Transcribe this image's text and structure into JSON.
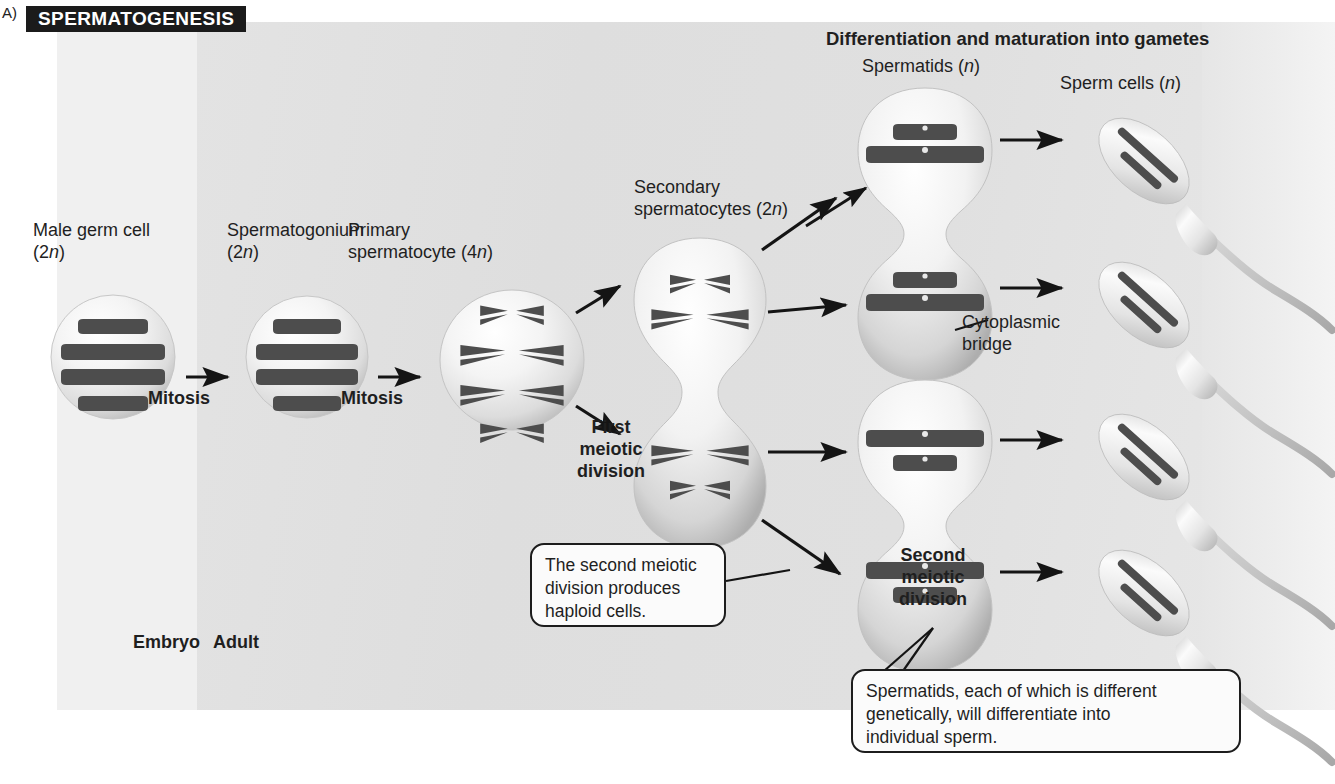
{
  "figure": {
    "letter": "A)",
    "title": "SPERMATOGENESIS",
    "title_bg": "#1b1b1b",
    "title_fg": "#ffffff"
  },
  "headings": {
    "differentiation": "Differentiation and maturation into gametes"
  },
  "stage_labels": {
    "male_germ_cell": "Male germ cell\n(2n)",
    "spermatogonium": "Spermatogonium\n(2n)",
    "primary_spermatocyte": "Primary\nspermatocyte (4n)",
    "secondary_spermatocytes": "Secondary\nspermatocytes (2n)",
    "spermatids": "Spermatids (n)",
    "sperm_cells": "Sperm cells (n)"
  },
  "process_labels": {
    "mitosis_1": "Mitosis",
    "mitosis_2": "Mitosis",
    "first_meiotic_division": "First\nmeiotic\ndivision",
    "second_meiotic_division": "Second\nmeiotic\ndivision"
  },
  "annotations": {
    "cytoplasmic_bridge": "Cytoplasmic\nbridge",
    "embryo": "Embryo",
    "adult": "Adult"
  },
  "callouts": {
    "haploid": "The second meiotic\ndivision produces\nhaploid cells.",
    "spermatids": "Spermatids, each of which is different\ngenetically, will differentiate into\nindividual sperm."
  },
  "colors": {
    "panel_embryo": "#f0f0f0",
    "panel_adult": "#e1e1e1",
    "chromosome": "#4a4a4a",
    "cell_fill": "#f3f3f3",
    "cell_shadow": "#b9b9b9",
    "arrow": "#141414",
    "text": "#1f1f1f"
  },
  "diagram_data": {
    "type": "process-flow",
    "cells": [
      {
        "name": "male germ cell",
        "ploidy": "2n",
        "chromosomes": 4,
        "shape": "round",
        "x": 113,
        "y": 357
      },
      {
        "name": "spermatogonium",
        "ploidy": "2n",
        "chromosomes": 4,
        "shape": "round",
        "x": 307,
        "y": 357
      },
      {
        "name": "primary spermatocyte",
        "ploidy": "4n",
        "chromosomes": 4,
        "shape": "round",
        "x": 512,
        "y": 357
      },
      {
        "name": "secondary spermatocyte upper",
        "ploidy": "2n",
        "chromosomes": 2,
        "shape": "round",
        "x": 700,
        "y": 300
      },
      {
        "name": "secondary spermatocyte lower",
        "ploidy": "2n",
        "chromosomes": 2,
        "shape": "round",
        "x": 700,
        "y": 460
      },
      {
        "name": "spermatid 1",
        "ploidy": "n",
        "chromosomes": 2,
        "shape": "round",
        "x": 925,
        "y": 148
      },
      {
        "name": "spermatid 2",
        "ploidy": "n",
        "chromosomes": 2,
        "shape": "round",
        "x": 925,
        "y": 295
      },
      {
        "name": "spermatid 3",
        "ploidy": "n",
        "chromosomes": 2,
        "shape": "round",
        "x": 925,
        "y": 443
      },
      {
        "name": "spermatid 4",
        "ploidy": "n",
        "chromosomes": 2,
        "shape": "round",
        "x": 925,
        "y": 580
      },
      {
        "name": "sperm cell 1",
        "ploidy": "n",
        "chromosomes": 2,
        "shape": "sperm",
        "x": 1150,
        "y": 150
      },
      {
        "name": "sperm cell 2",
        "ploidy": "n",
        "chromosomes": 2,
        "shape": "sperm",
        "x": 1150,
        "y": 300
      },
      {
        "name": "sperm cell 3",
        "ploidy": "n",
        "chromosomes": 2,
        "shape": "sperm",
        "x": 1150,
        "y": 455
      },
      {
        "name": "sperm cell 4",
        "ploidy": "n",
        "chromosomes": 2,
        "shape": "sperm",
        "x": 1150,
        "y": 600
      }
    ],
    "transitions": [
      {
        "from": "male germ cell",
        "to": "spermatogonium",
        "label": "Mitosis"
      },
      {
        "from": "spermatogonium",
        "to": "primary spermatocyte",
        "label": "Mitosis"
      },
      {
        "from": "primary spermatocyte",
        "to": "secondary spermatocytes",
        "label": "First meiotic division"
      },
      {
        "from": "secondary spermatocytes",
        "to": "spermatids",
        "label": "Second meiotic division"
      },
      {
        "from": "spermatids",
        "to": "sperm cells",
        "label": "Differentiation and maturation into gametes"
      }
    ]
  }
}
